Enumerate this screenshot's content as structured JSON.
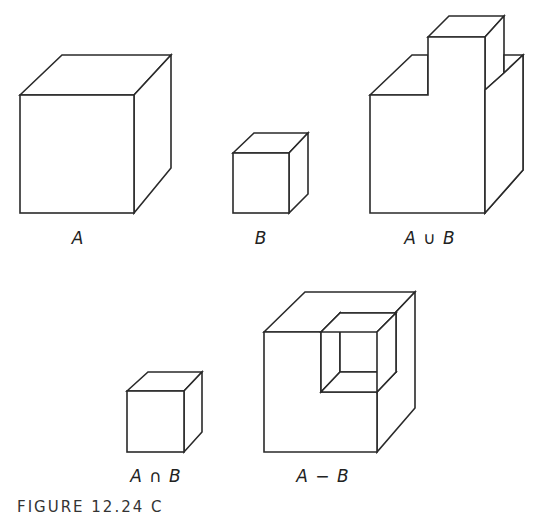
{
  "figure": {
    "panels": [
      {
        "id": "A",
        "label": "A",
        "description": "large cube"
      },
      {
        "id": "B",
        "label": "B",
        "description": "small cube"
      },
      {
        "id": "union",
        "label": "A ∪ B",
        "description": "union of cube A and cube B"
      },
      {
        "id": "intersection",
        "label": "A ∩ B",
        "description": "intersection of A and B (small cube)"
      },
      {
        "id": "difference",
        "label": "A − B",
        "description": "cube A with corner notch removed by B"
      }
    ],
    "caption": "FIGURE 12.24  C"
  },
  "colors": {
    "stroke": "#2a2a2a",
    "fill": "#ffffff",
    "text": "#222222"
  }
}
